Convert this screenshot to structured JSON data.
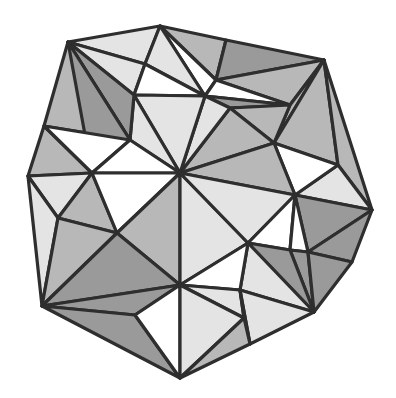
{
  "diagram": {
    "type": "triangulated-polygon",
    "stroke_color": "#2e2e2e",
    "stroke_width": 3.2,
    "fills": {
      "white": "#ffffff",
      "light": "#e4e4e4",
      "medium": "#b8b8b8",
      "dark": "#9a9a9a"
    },
    "vertices": {
      "A": [
        68,
        42
      ],
      "B": [
        160,
        26
      ],
      "C": [
        226,
        40
      ],
      "D": [
        324,
        60
      ],
      "E": [
        372,
        210
      ],
      "F": [
        352,
        262
      ],
      "G": [
        314,
        312
      ],
      "H": [
        250,
        344
      ],
      "I": [
        180,
        378
      ],
      "J": [
        122,
        348
      ],
      "K": [
        42,
        306
      ],
      "L": [
        28,
        176
      ],
      "M": [
        44,
        126
      ],
      "N": [
        134,
        95
      ],
      "O": [
        205,
        96
      ],
      "P": [
        92,
        173
      ],
      "Q": [
        180,
        173
      ],
      "R": [
        295,
        195
      ],
      "S": [
        117,
        233
      ],
      "U": [
        248,
        243
      ],
      "V": [
        180,
        285
      ],
      "W": [
        274,
        143
      ],
      "X": [
        290,
        105
      ],
      "Y": [
        216,
        80
      ],
      "Z": [
        145,
        64
      ],
      "a1": [
        230,
        108
      ],
      "a2": [
        338,
        165
      ],
      "a3": [
        290,
        250
      ],
      "a4": [
        308,
        252
      ],
      "a5": [
        244,
        318
      ],
      "a6": [
        240,
        290
      ],
      "a7": [
        135,
        315
      ],
      "a8": [
        58,
        218
      ],
      "a9": [
        130,
        140
      ],
      "b1": [
        80,
        175
      ]
    },
    "triangles": [
      {
        "v": [
          "A",
          "B",
          "Z"
        ],
        "fill": "light"
      },
      {
        "v": [
          "B",
          "C",
          "Y"
        ],
        "fill": "medium"
      },
      {
        "v": [
          "B",
          "Y",
          "O"
        ],
        "fill": "white"
      },
      {
        "v": [
          "B",
          "Z",
          "O"
        ],
        "fill": "light"
      },
      {
        "v": [
          "A",
          "Z",
          "N"
        ],
        "fill": "light"
      },
      {
        "v": [
          "Z",
          "O",
          "N"
        ],
        "fill": "white"
      },
      {
        "v": [
          "C",
          "D",
          "Y"
        ],
        "fill": "dark"
      },
      {
        "v": [
          "Y",
          "D",
          "X"
        ],
        "fill": "medium"
      },
      {
        "v": [
          "Y",
          "X",
          "O"
        ],
        "fill": "white"
      },
      {
        "v": [
          "O",
          "X",
          "a1"
        ],
        "fill": "dark"
      },
      {
        "v": [
          "X",
          "D",
          "W"
        ],
        "fill": "medium"
      },
      {
        "v": [
          "D",
          "a2",
          "W"
        ],
        "fill": "medium"
      },
      {
        "v": [
          "D",
          "E",
          "a2"
        ],
        "fill": "medium"
      },
      {
        "v": [
          "a2",
          "E",
          "R"
        ],
        "fill": "light"
      },
      {
        "v": [
          "W",
          "a2",
          "R"
        ],
        "fill": "white"
      },
      {
        "v": [
          "a1",
          "X",
          "W"
        ],
        "fill": "medium"
      },
      {
        "v": [
          "a1",
          "W",
          "Q"
        ],
        "fill": "medium"
      },
      {
        "v": [
          "Q",
          "W",
          "R"
        ],
        "fill": "medium"
      },
      {
        "v": [
          "O",
          "a1",
          "Q"
        ],
        "fill": "light"
      },
      {
        "v": [
          "N",
          "O",
          "Q"
        ],
        "fill": "light"
      },
      {
        "v": [
          "N",
          "Q",
          "a9"
        ],
        "fill": "light"
      },
      {
        "v": [
          "A",
          "N",
          "a9"
        ],
        "fill": "dark"
      },
      {
        "v": [
          "A",
          "M",
          "a9"
        ],
        "fill": "medium"
      },
      {
        "v": [
          "A",
          "a9",
          "P"
        ],
        "fill": "dark"
      },
      {
        "v": [
          "M",
          "P",
          "L"
        ],
        "fill": "medium"
      },
      {
        "v": [
          "M",
          "a9",
          "P"
        ],
        "fill": "white"
      },
      {
        "v": [
          "a9",
          "Q",
          "P"
        ],
        "fill": "white"
      },
      {
        "v": [
          "L",
          "P",
          "a8"
        ],
        "fill": "light"
      },
      {
        "v": [
          "L",
          "a8",
          "K"
        ],
        "fill": "light"
      },
      {
        "v": [
          "P",
          "S",
          "a8"
        ],
        "fill": "medium"
      },
      {
        "v": [
          "P",
          "Q",
          "S"
        ],
        "fill": "white"
      },
      {
        "v": [
          "Q",
          "S",
          "V"
        ],
        "fill": "medium"
      },
      {
        "v": [
          "a8",
          "S",
          "K"
        ],
        "fill": "medium"
      },
      {
        "v": [
          "S",
          "V",
          "K"
        ],
        "fill": "dark"
      },
      {
        "v": [
          "K",
          "V",
          "a7"
        ],
        "fill": "dark"
      },
      {
        "v": [
          "K",
          "a7",
          "I"
        ],
        "fill": "dark"
      },
      {
        "v": [
          "a7",
          "V",
          "I"
        ],
        "fill": "white"
      },
      {
        "v": [
          "Q",
          "U",
          "V"
        ],
        "fill": "light"
      },
      {
        "v": [
          "Q",
          "R",
          "U"
        ],
        "fill": "light"
      },
      {
        "v": [
          "R",
          "a3",
          "U"
        ],
        "fill": "white"
      },
      {
        "v": [
          "R",
          "E",
          "a4"
        ],
        "fill": "dark"
      },
      {
        "v": [
          "R",
          "a4",
          "a3"
        ],
        "fill": "white"
      },
      {
        "v": [
          "a4",
          "E",
          "F"
        ],
        "fill": "dark"
      },
      {
        "v": [
          "a3",
          "a4",
          "G"
        ],
        "fill": "dark"
      },
      {
        "v": [
          "a4",
          "F",
          "G"
        ],
        "fill": "dark"
      },
      {
        "v": [
          "U",
          "a3",
          "G"
        ],
        "fill": "dark"
      },
      {
        "v": [
          "U",
          "G",
          "a6"
        ],
        "fill": "light"
      },
      {
        "v": [
          "V",
          "U",
          "a6"
        ],
        "fill": "white"
      },
      {
        "v": [
          "V",
          "a6",
          "a5"
        ],
        "fill": "light"
      },
      {
        "v": [
          "a6",
          "G",
          "H"
        ],
        "fill": "light"
      },
      {
        "v": [
          "a6",
          "H",
          "a5"
        ],
        "fill": "light"
      },
      {
        "v": [
          "V",
          "a5",
          "I"
        ],
        "fill": "light"
      },
      {
        "v": [
          "a5",
          "H",
          "I"
        ],
        "fill": "medium"
      }
    ]
  }
}
